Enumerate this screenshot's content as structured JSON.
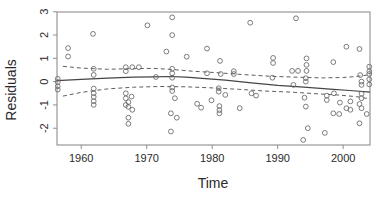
{
  "chart_data": {
    "type": "scatter",
    "title": "",
    "xlabel": "Time",
    "ylabel": "Residuals",
    "xlim": [
      1956.3,
      2004.1
    ],
    "ylim": [
      -2.72,
      2.99
    ],
    "x_ticks": [
      1960,
      1970,
      1980,
      1990,
      2000
    ],
    "y_ticks": [
      -2,
      -1,
      0,
      1,
      2,
      3
    ],
    "grid": false,
    "legend": "none",
    "marker": "open-circle",
    "points": [
      [
        1956.4,
        0.12
      ],
      [
        1956.4,
        -0.02
      ],
      [
        1956.4,
        -0.2
      ],
      [
        1956.4,
        -0.34
      ],
      [
        1958.0,
        1.44
      ],
      [
        1958.0,
        1.08
      ],
      [
        1961.8,
        2.05
      ],
      [
        1961.9,
        0.55
      ],
      [
        1961.9,
        0.29
      ],
      [
        1961.9,
        -0.3
      ],
      [
        1961.9,
        -0.5
      ],
      [
        1961.9,
        -0.66
      ],
      [
        1961.9,
        -0.84
      ],
      [
        1961.9,
        -1.0
      ],
      [
        1966.8,
        0.62
      ],
      [
        1966.8,
        0.45
      ],
      [
        1967.8,
        0.62
      ],
      [
        1968.8,
        0.62
      ],
      [
        1966.8,
        -0.5
      ],
      [
        1966.8,
        -0.72
      ],
      [
        1966.8,
        -1.0
      ],
      [
        1967.7,
        -0.64
      ],
      [
        1967.2,
        -0.88
      ],
      [
        1967.2,
        -1.08
      ],
      [
        1967.8,
        -1.21
      ],
      [
        1967.2,
        -1.55
      ],
      [
        1967.2,
        -1.81
      ],
      [
        1970.1,
        2.42
      ],
      [
        1971.4,
        0.2
      ],
      [
        1973.0,
        1.29
      ],
      [
        1973.9,
        2.76
      ],
      [
        1973.9,
        2.0
      ],
      [
        1973.9,
        0.55
      ],
      [
        1973.9,
        0.36
      ],
      [
        1973.9,
        0.17
      ],
      [
        1973.9,
        -0.25
      ],
      [
        1973.9,
        -0.4
      ],
      [
        1974.3,
        -0.71
      ],
      [
        1973.7,
        -1.36
      ],
      [
        1974.6,
        -1.55
      ],
      [
        1973.7,
        -2.14
      ],
      [
        1976.1,
        1.07
      ],
      [
        1977.7,
        -0.95
      ],
      [
        1978.3,
        -1.12
      ],
      [
        1979.2,
        1.42
      ],
      [
        1979.2,
        0.36
      ],
      [
        1979.9,
        -0.8
      ],
      [
        1981.2,
        0.89
      ],
      [
        1981.3,
        0.33
      ],
      [
        1981.0,
        -0.28
      ],
      [
        1981.0,
        -0.43
      ],
      [
        1982.0,
        -0.57
      ],
      [
        1981.1,
        -1.05
      ],
      [
        1981.1,
        -1.22
      ],
      [
        1981.1,
        -1.36
      ],
      [
        1983.3,
        0.45
      ],
      [
        1983.3,
        0.33
      ],
      [
        1984.2,
        -1.14
      ],
      [
        1985.8,
        2.53
      ],
      [
        1986.0,
        -0.5
      ],
      [
        1986.7,
        -0.6
      ],
      [
        1989.3,
        1.02
      ],
      [
        1989.3,
        0.8
      ],
      [
        1989.2,
        0.17
      ],
      [
        1992.8,
        2.72
      ],
      [
        1992.2,
        0.46
      ],
      [
        1993.1,
        0.46
      ],
      [
        1992.4,
        -0.14
      ],
      [
        1994.4,
        1.0
      ],
      [
        1994.4,
        0.72
      ],
      [
        1994.4,
        0.46
      ],
      [
        1994.3,
        0.15
      ],
      [
        1994.3,
        0.0
      ],
      [
        1994.1,
        -0.69
      ],
      [
        1994.3,
        -1.07
      ],
      [
        1994.6,
        -2.0
      ],
      [
        1993.9,
        -2.5
      ],
      [
        1997.5,
        -0.6
      ],
      [
        1997.5,
        -0.79
      ],
      [
        1997.2,
        -2.2
      ],
      [
        1998.5,
        0.84
      ],
      [
        1998.6,
        -0.5
      ],
      [
        1998.5,
        -1.36
      ],
      [
        1999.5,
        -0.9
      ],
      [
        1999.4,
        -1.39
      ],
      [
        2000.5,
        1.5
      ],
      [
        2000.5,
        -1.14
      ],
      [
        2001.1,
        -0.85
      ],
      [
        2001.1,
        -1.21
      ],
      [
        2002.5,
        1.4
      ],
      [
        2002.5,
        -0.96
      ],
      [
        2002.5,
        -1.79
      ],
      [
        2002.6,
        0.28
      ],
      [
        2002.8,
        0.0
      ],
      [
        2002.8,
        -0.14
      ],
      [
        2002.8,
        -0.52
      ],
      [
        2002.8,
        -0.71
      ],
      [
        2002.8,
        -1.14
      ],
      [
        2003.6,
        -1.39
      ],
      [
        2004.0,
        0.64
      ],
      [
        2004.0,
        0.45
      ],
      [
        2004.0,
        0.33
      ],
      [
        2004.0,
        0.1
      ],
      [
        2004.0,
        -0.12
      ]
    ],
    "series": [
      {
        "name": "smooth-fit",
        "style": "solid",
        "values": [
          [
            1956.3,
            0.04
          ],
          [
            1960,
            0.1
          ],
          [
            1964,
            0.15
          ],
          [
            1968,
            0.19
          ],
          [
            1971,
            0.21
          ],
          [
            1973.5,
            0.22
          ],
          [
            1976,
            0.19
          ],
          [
            1979,
            0.13
          ],
          [
            1982,
            0.06
          ],
          [
            1986,
            -0.05
          ],
          [
            1990,
            -0.16
          ],
          [
            1994,
            -0.24
          ],
          [
            1998,
            -0.32
          ],
          [
            2001,
            -0.38
          ],
          [
            2004.1,
            -0.45
          ]
        ]
      },
      {
        "name": "confidence-upper",
        "style": "dashed",
        "values": [
          [
            1957.2,
            0.66
          ],
          [
            1960,
            0.58
          ],
          [
            1964,
            0.53
          ],
          [
            1968,
            0.56
          ],
          [
            1971,
            0.57
          ],
          [
            1974,
            0.52
          ],
          [
            1977,
            0.45
          ],
          [
            1981,
            0.38
          ],
          [
            1985,
            0.3
          ],
          [
            1989,
            0.23
          ],
          [
            1993,
            0.19
          ],
          [
            1997,
            0.16
          ],
          [
            2000,
            0.18
          ],
          [
            2002,
            0.22
          ],
          [
            2004.1,
            0.3
          ]
        ]
      },
      {
        "name": "confidence-lower",
        "style": "dashed",
        "values": [
          [
            1957.2,
            -0.62
          ],
          [
            1960,
            -0.46
          ],
          [
            1964,
            -0.31
          ],
          [
            1968,
            -0.24
          ],
          [
            1972,
            -0.21
          ],
          [
            1976,
            -0.22
          ],
          [
            1980,
            -0.27
          ],
          [
            1984,
            -0.33
          ],
          [
            1988,
            -0.4
          ],
          [
            1992,
            -0.45
          ],
          [
            1996,
            -0.52
          ],
          [
            1999,
            -0.57
          ],
          [
            2002,
            -0.64
          ],
          [
            2004.1,
            -0.74
          ]
        ]
      }
    ],
    "colors": {
      "background": "#ffffff",
      "frame": "#8f8f8f",
      "point_stroke": "#6d6d6d",
      "smooth_line": "#454545",
      "band_line": "#5e5e5e",
      "text": "#2a2a2a"
    },
    "layout": {
      "plot_left": 57,
      "plot_right": 370,
      "plot_top": 12,
      "plot_bottom": 145,
      "tick_length": 4
    }
  }
}
